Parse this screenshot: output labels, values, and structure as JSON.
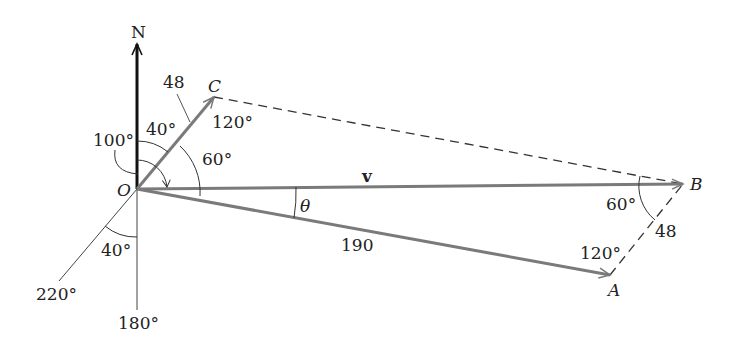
{
  "diagram": {
    "type": "vector-diagram",
    "points": {
      "origin": "O",
      "north": "N",
      "a": "A",
      "b": "B",
      "c": "C"
    },
    "vectors": {
      "resultant": "v",
      "oa_magnitude": "190",
      "oc_magnitude": "48",
      "ab_magnitude": "48"
    },
    "angles": {
      "theta": "θ",
      "bearing_100": "100°",
      "angle_40_top": "40°",
      "angle_60_at_o": "60°",
      "angle_120_at_c": "120°",
      "angle_60_at_b": "60°",
      "angle_120_at_a": "120°",
      "angle_40_bottom": "40°",
      "bearing_220": "220°",
      "bearing_180": "180°"
    },
    "colors": {
      "vector_gray": "#7a7a7a",
      "axis_black": "#111111",
      "text": "#222222"
    }
  }
}
